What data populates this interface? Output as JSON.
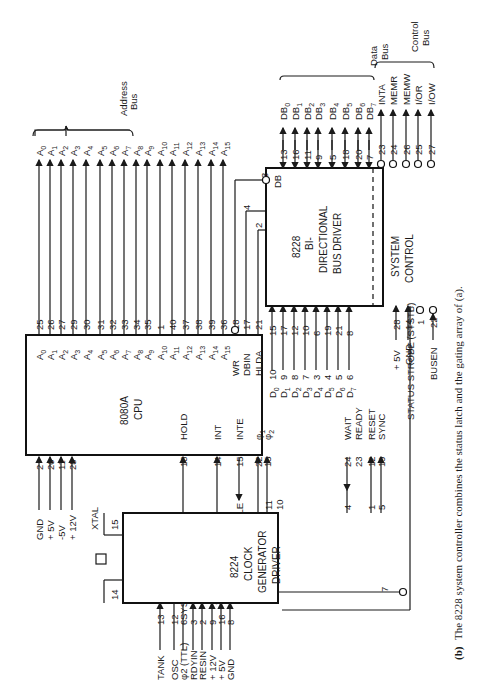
{
  "caption": {
    "label": "(b)",
    "text": "The 8228 system controller combines the status latch and the gating array of (a)."
  },
  "cpu": {
    "name": "8080A",
    "subtitle": "CPU",
    "address_pins": [
      {
        "signal": "A0",
        "pin": "25"
      },
      {
        "signal": "A1",
        "pin": "26"
      },
      {
        "signal": "A2",
        "pin": "27"
      },
      {
        "signal": "A3",
        "pin": "29"
      },
      {
        "signal": "A4",
        "pin": "30"
      },
      {
        "signal": "A5",
        "pin": "31"
      },
      {
        "signal": "A6",
        "pin": "32"
      },
      {
        "signal": "A7",
        "pin": "33"
      },
      {
        "signal": "A8",
        "pin": "34"
      },
      {
        "signal": "A9",
        "pin": "35"
      },
      {
        "signal": "A10",
        "pin": "1"
      },
      {
        "signal": "A11",
        "pin": "40"
      },
      {
        "signal": "A12",
        "pin": "37"
      },
      {
        "signal": "A13",
        "pin": "38"
      },
      {
        "signal": "A14",
        "pin": "39"
      },
      {
        "signal": "A15",
        "pin": "36"
      }
    ],
    "control_out": [
      {
        "signal": "WR",
        "pin": "18"
      },
      {
        "signal": "DBIN",
        "pin": "17"
      },
      {
        "signal": "HLDA",
        "pin": "21"
      }
    ],
    "data_pins": [
      {
        "signal": "D0",
        "pin": "10"
      },
      {
        "signal": "D1",
        "pin": "9"
      },
      {
        "signal": "D2",
        "pin": "8"
      },
      {
        "signal": "D3",
        "pin": "7"
      },
      {
        "signal": "D4",
        "pin": "3"
      },
      {
        "signal": "D5",
        "pin": "4"
      },
      {
        "signal": "D6",
        "pin": "5"
      },
      {
        "signal": "D7",
        "pin": "6"
      }
    ],
    "power_pins": [
      {
        "signal": "GND",
        "pin": "2"
      },
      {
        "signal": "+ 5V",
        "pin": "20"
      },
      {
        "signal": "-5V",
        "pin": "11"
      },
      {
        "signal": "+ 12V",
        "pin": "28"
      }
    ],
    "bottom_pins": [
      {
        "signal": "HOLD",
        "pin": "13"
      },
      {
        "signal": "INT",
        "pin": "14"
      },
      {
        "signal": "INTE",
        "pin": "15"
      },
      {
        "signal": "φ1",
        "pin": "22"
      },
      {
        "signal": "φ2",
        "pin": "15"
      },
      {
        "signal": "WAIT",
        "pin": "24"
      },
      {
        "signal": "READY",
        "pin": "23"
      },
      {
        "signal": "RESET",
        "pin": "12"
      },
      {
        "signal": "SYNC",
        "pin": "19"
      }
    ]
  },
  "controller": {
    "name": "8228",
    "line1": "BI-",
    "line2": "DIRECTIONAL",
    "line3": "BUS DRIVER",
    "section2_line1": "SYSTEM",
    "section2_line2": "CONTROL",
    "db_label": "DB",
    "db_pins": [
      {
        "signal": "DB0",
        "pin": "13"
      },
      {
        "signal": "DB1",
        "pin": "16"
      },
      {
        "signal": "DB2",
        "pin": "11"
      },
      {
        "signal": "DB3",
        "pin": "9"
      },
      {
        "signal": "DB4",
        "pin": "5"
      },
      {
        "signal": "DB5",
        "pin": "18"
      },
      {
        "signal": "DB6",
        "pin": "20"
      },
      {
        "signal": "DB7",
        "pin": "7"
      }
    ],
    "d_pins": [
      "15",
      "17",
      "12",
      "10",
      "6",
      "19",
      "21",
      "8"
    ],
    "control_pins": [
      {
        "signal": "INTA",
        "pin": "23"
      },
      {
        "signal": "MEMR",
        "pin": "24"
      },
      {
        "signal": "MEMW",
        "pin": "26"
      },
      {
        "signal": "I/OR",
        "pin": "25"
      },
      {
        "signal": "I/OW",
        "pin": "27"
      }
    ],
    "left_pins": [
      {
        "pin": "3"
      },
      {
        "pin": "4"
      },
      {
        "pin": "2"
      }
    ],
    "power": [
      {
        "signal": "+ 5V",
        "pin": "28"
      },
      {
        "signal": "GND",
        "pin": "14"
      }
    ],
    "sts_pin": "1",
    "busen": {
      "signal": "BUSEN",
      "pin": "22"
    }
  },
  "clock": {
    "name": "8224",
    "line1": "CLOCK",
    "line2": "GENERATOR",
    "line3": "DRIVER",
    "xtal_label": "XTAL",
    "xtal_pins": [
      "14",
      "15"
    ],
    "top_pins": [
      "11",
      "10",
      "4",
      "1",
      "5"
    ],
    "sts_pin": "7",
    "left_pins": [
      {
        "signal": "TANK",
        "pin": "13"
      },
      {
        "signal": "OSC",
        "pin": "12"
      },
      {
        "signal": "φ2 (TTL)",
        "pin": "6"
      },
      {
        "signal": "RDYIN",
        "pin": "3"
      },
      {
        "signal": "RESIN",
        "pin": "2"
      },
      {
        "signal": "+ 12V",
        "pin": "9"
      },
      {
        "signal": "+ 5V",
        "pin": "16"
      },
      {
        "signal": "GND",
        "pin": "8"
      }
    ]
  },
  "system_signals": {
    "dma_req": "SYSTEM DMA REQ",
    "int_req": "SYSTEM INT. REQ.",
    "int_enable": "INT. ENABLE",
    "status_strobe": "STATUS STROBE (STSTB)"
  },
  "buses": {
    "address": {
      "line1": "Address",
      "line2": "Bus"
    },
    "data": {
      "line1": "Data",
      "line2": "Bus"
    },
    "control": {
      "line1": "Control",
      "line2": "Bus"
    }
  }
}
